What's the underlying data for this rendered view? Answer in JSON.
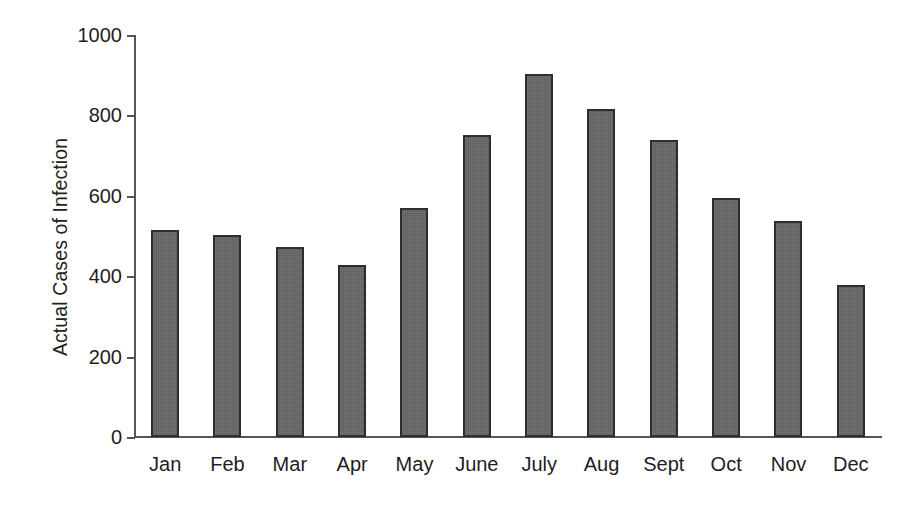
{
  "chart_data": {
    "type": "bar",
    "title": "",
    "subtitle": "",
    "xlabel": "",
    "ylabel": "Actual Cases of Infection",
    "categories": [
      "Jan",
      "Feb",
      "Mar",
      "Apr",
      "May",
      "June",
      "July",
      "Aug",
      "Sept",
      "Oct",
      "Nov",
      "Dec"
    ],
    "values": [
      515,
      502,
      472,
      428,
      570,
      752,
      903,
      817,
      740,
      595,
      537,
      377
    ],
    "ylim": [
      0,
      1000
    ],
    "yticks": [
      0,
      200,
      400,
      600,
      800,
      1000
    ],
    "ytick_labels": [
      "0",
      "200",
      "400",
      "600",
      "800",
      "1000"
    ],
    "grid": false,
    "legend": false,
    "legend_position": "none",
    "bar_fill_color": "#636366",
    "bar_border_color": "#2e2e30",
    "axis_color": "#555558",
    "text_color": "#1e1e1e",
    "background_color": "#ffffff"
  }
}
